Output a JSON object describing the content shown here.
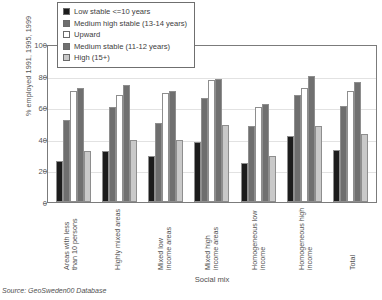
{
  "chart_data": {
    "type": "bar",
    "title": "",
    "xlabel": "Social mix",
    "ylabel": "% employed 1991, 1995, 1999",
    "ylim": [
      0,
      100
    ],
    "yticks": [
      0,
      20,
      40,
      60,
      80,
      100
    ],
    "grid": true,
    "legend_position": "top-left-inside",
    "categories": [
      "Areas with less than 10 persons",
      "Highly mixed areas",
      "Mixed low income areas",
      "Mixed high income areas",
      "Homogeneous low income",
      "Homogeneous high income",
      "Total"
    ],
    "series": [
      {
        "name": "Low stable <=10 years",
        "color": "#1c1c1c",
        "values": [
          26,
          32,
          29,
          38,
          25,
          42,
          33
        ]
      },
      {
        "name": "Medium high stable (13-14 years)",
        "color": "#6e6e6e",
        "values": [
          52,
          60,
          50,
          66,
          48,
          68,
          61
        ]
      },
      {
        "name": "Upward",
        "color": "#ffffff",
        "values": [
          70,
          68,
          69,
          77,
          60,
          72,
          70
        ]
      },
      {
        "name": "Medium stable (11-12 years)",
        "color": "#707070",
        "values": [
          72,
          74,
          70,
          78,
          62,
          80,
          76
        ]
      },
      {
        "name": "High (15+)",
        "color": "#c9c9c9",
        "values": [
          32,
          39,
          39,
          49,
          29,
          48,
          43
        ]
      }
    ]
  },
  "legend": {
    "items": [
      {
        "label": "Low stable <=10 years",
        "color": "#1c1c1c"
      },
      {
        "label": "Medium high stable (13-14 years)",
        "color": "#6e6e6e"
      },
      {
        "label": "Upward",
        "color": "#ffffff"
      },
      {
        "label": "Medium stable (11-12 years)",
        "color": "#707070"
      },
      {
        "label": "High (15+)",
        "color": "#c9c9c9"
      }
    ]
  },
  "axis": {
    "y_title": "% employed 1991, 1995, 1999",
    "x_title": "Social mix",
    "y_tick_labels": [
      "100",
      "80",
      "60",
      "40",
      "20",
      "0"
    ]
  },
  "category_labels": [
    {
      "line1": "Areas with less",
      "line2": "than 10 persons"
    },
    {
      "line1": "Highly mixed areas",
      "line2": ""
    },
    {
      "line1": "Mixed low",
      "line2": "income areas"
    },
    {
      "line1": "Mixed high",
      "line2": "income areas"
    },
    {
      "line1": "Homogeneous low",
      "line2": "income"
    },
    {
      "line1": "Homogeneous high",
      "line2": "income"
    },
    {
      "line1": "Total",
      "line2": ""
    }
  ],
  "source": {
    "text": "Source: GeoSweden00 Database"
  }
}
